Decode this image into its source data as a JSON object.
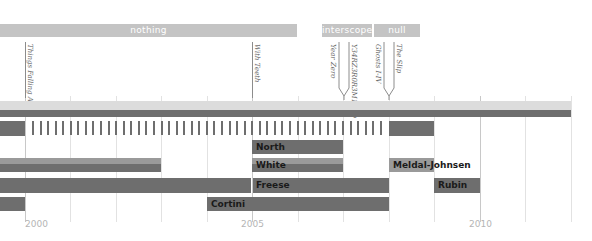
{
  "chart_data": {
    "type": "gantt-timeline",
    "title": "",
    "x_axis": {
      "min": 1999.5,
      "max": 2011.5,
      "tick_labels": [
        "2000",
        "2005",
        "2010"
      ],
      "gridlines_per_year": 1
    },
    "label_periods": [
      {
        "label": "nothing",
        "start": 1999.5,
        "end": 2006.0
      },
      {
        "label": "interscope",
        "start": 2006.5,
        "end": 2007.6
      },
      {
        "label": "null",
        "start": 2007.65,
        "end": 2008.65
      }
    ],
    "releases": [
      {
        "title": "Things Falling Apart",
        "year": 2000.0
      },
      {
        "title": "With Teeth",
        "year": 2005.0
      },
      {
        "title": "Year Zero",
        "year": 2007.0
      },
      {
        "title": "Y34RZ3R0R3M1X3D",
        "year": 2007.0
      },
      {
        "title": "Ghosts I-IV",
        "year": 2008.0
      },
      {
        "title": "The Slip",
        "year": 2008.0
      }
    ],
    "rows": [
      {
        "name": "Reznor",
        "segments": [
          {
            "start": 1999.5,
            "end": 2011.5
          }
        ]
      },
      {
        "name": "Drums",
        "segments": [
          {
            "start": 1999.5,
            "end": 2000.0,
            "style": "solid"
          },
          {
            "start": 2000.0,
            "end": 2008.0,
            "style": "dashed"
          },
          {
            "start": 2008.0,
            "end": 2009.0,
            "style": "solid"
          }
        ]
      },
      {
        "name": "North",
        "segments": [
          {
            "start": 2005.0,
            "end": 2007.0,
            "label": "North"
          }
        ]
      },
      {
        "name": "White",
        "segments": [
          {
            "start": 1999.5,
            "end": 2003.0
          },
          {
            "start": 2005.0,
            "end": 2007.0,
            "label": "White"
          }
        ]
      },
      {
        "name": "Meldal-Johnsen",
        "segments": [
          {
            "start": 2008.0,
            "end": 2009.0,
            "label": "Meldal-Johnsen"
          }
        ]
      },
      {
        "name": "Freese",
        "segments": [
          {
            "start": 1999.5,
            "end": 2005.0
          },
          {
            "start": 2005.0,
            "end": 2008.0,
            "label": "Freese"
          }
        ]
      },
      {
        "name": "Rubin",
        "segments": [
          {
            "start": 2009.0,
            "end": 2010.0,
            "label": "Rubin"
          }
        ]
      },
      {
        "name": "Cortini",
        "segments": [
          {
            "start": 1999.5,
            "end": 2000.0
          },
          {
            "start": 2004.0,
            "end": 2008.0,
            "label": "Cortini"
          }
        ]
      }
    ]
  },
  "labels": {
    "nothing": "nothing",
    "interscope": "interscope",
    "null": "null"
  },
  "releases": {
    "r1": "Things Falling Apart",
    "r2": "With Teeth",
    "r3": "Year Zero",
    "r4": "Y34RZ3R0R3M1X3D",
    "r5": "Ghosts I-IV",
    "r6": "The Slip"
  },
  "members": {
    "north": "North",
    "white": "White",
    "meldal": "Meldal-Johnsen",
    "freese": "Freese",
    "rubin": "Rubin",
    "cortini": "Cortini"
  },
  "axis": {
    "y2000": "2000",
    "y2005": "2005",
    "y2010": "2010"
  },
  "colors": {
    "bar_dark": "#6e6e6e",
    "bar_light": "#9a9a9a",
    "label_bar": "#c4c4c4",
    "grid": "#e2e2e2"
  }
}
